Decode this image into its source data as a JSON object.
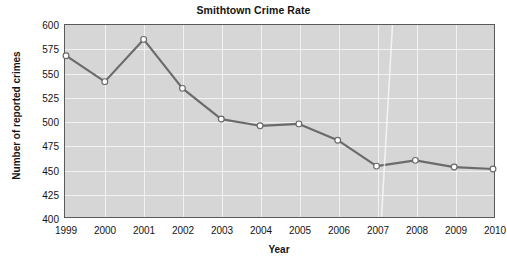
{
  "chart_data": {
    "type": "line",
    "title": "Smithtown Crime Rate",
    "xlabel": "Year",
    "ylabel": "Number of reported crimes",
    "categories": [
      "1999",
      "2000",
      "2001",
      "2002",
      "2003",
      "2004",
      "2005",
      "2006",
      "2007",
      "2008",
      "2009",
      "2010"
    ],
    "values": [
      568,
      541,
      585,
      534,
      502,
      495,
      497,
      480,
      453,
      459,
      452,
      450
    ],
    "ylim": [
      400,
      600
    ],
    "yticks": [
      400,
      425,
      450,
      475,
      500,
      525,
      550,
      575,
      600
    ],
    "ytick_labels": [
      "400",
      "425",
      "450",
      "475",
      "500",
      "525",
      "550",
      "575",
      "600"
    ],
    "xtick_labels": [
      "1999",
      "2000",
      "2001",
      "2002",
      "2003",
      "2004",
      "2005",
      "2006",
      "2007",
      "2008",
      "2009",
      "2010"
    ],
    "grid": true,
    "legend": false,
    "series": [
      {
        "name": "Number of reported crimes",
        "values": [
          568,
          541,
          585,
          534,
          502,
          495,
          497,
          480,
          453,
          459,
          452,
          450
        ]
      }
    ],
    "colors": {
      "plot_background": "#d6d6d6",
      "grid": "#f2f2f2",
      "line": "#6b6b6b",
      "marker_fill": "#ffffff",
      "marker_edge": "#6b6b6b",
      "axis": "#5a5a5a",
      "text": "#141414",
      "page_background": "#ffffff"
    }
  }
}
